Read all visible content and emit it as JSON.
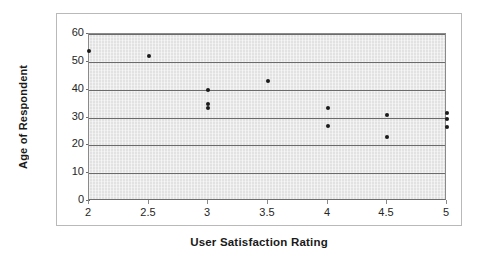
{
  "chart_data": {
    "type": "scatter",
    "title": "",
    "xlabel": "User Satisfaction Rating",
    "ylabel": "Age of Respondent",
    "xlim": [
      2,
      5
    ],
    "ylim": [
      0,
      60
    ],
    "xticks": [
      "2",
      "2.5",
      "3",
      "3.5",
      "4",
      "4.5",
      "5"
    ],
    "xtick_values": [
      2,
      2.5,
      3,
      3.5,
      4,
      4.5,
      5
    ],
    "yticks": [
      "0",
      "10",
      "20",
      "30",
      "40",
      "50",
      "60"
    ],
    "ytick_values": [
      0,
      10,
      20,
      30,
      40,
      50,
      60
    ],
    "grid": true,
    "grid_axis": "y",
    "legend": "none",
    "series": [
      {
        "name": "Respondents",
        "marker": "filled-circle",
        "color": "#1a1a1a",
        "points": [
          {
            "x": 2,
            "y": 54
          },
          {
            "x": 2.5,
            "y": 52
          },
          {
            "x": 3,
            "y": 40
          },
          {
            "x": 3,
            "y": 35
          },
          {
            "x": 3,
            "y": 33.5
          },
          {
            "x": 3.5,
            "y": 43
          },
          {
            "x": 4,
            "y": 33.5
          },
          {
            "x": 4,
            "y": 27
          },
          {
            "x": 4.5,
            "y": 31
          },
          {
            "x": 4.5,
            "y": 23
          },
          {
            "x": 5,
            "y": 31.5
          },
          {
            "x": 5,
            "y": 29.5
          },
          {
            "x": 5,
            "y": 26.5
          }
        ]
      }
    ],
    "colors": {
      "plot_background": "#e2e2e2",
      "gridline": "#6b6b6b",
      "marker": "#1a1a1a",
      "frame_border": "#b9b9b9",
      "text": "#1a1a1a"
    }
  }
}
